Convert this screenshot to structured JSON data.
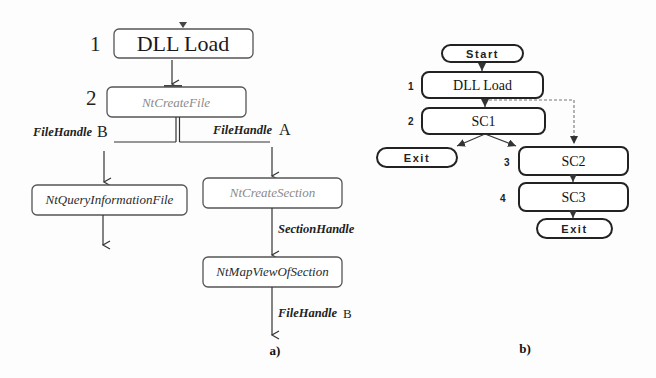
{
  "figure": {
    "panel_a": {
      "caption": "a)",
      "steps": {
        "s1": "1",
        "s2": "2"
      },
      "nodes": {
        "dll_load": "DLL Load",
        "nt_create_file": "NtCreateFile",
        "nt_query_information_file": "NtQueryInformationFile",
        "nt_create_section": "NtCreateSection",
        "nt_map_view_of_section": "NtMapViewOfSection"
      },
      "edge_labels": {
        "left_branch": {
          "text": "FileHandle",
          "suffix": "B"
        },
        "right_branch": {
          "text": "FileHandle",
          "suffix": "A"
        },
        "section_handle": {
          "text": "SectionHandle"
        },
        "map_output": {
          "text": "FileHandle",
          "suffix": "B"
        }
      }
    },
    "panel_b": {
      "caption": "b)",
      "steps": {
        "s1": "1",
        "s2": "2",
        "s3": "3",
        "s4": "4"
      },
      "nodes": {
        "start": "Start",
        "dll_load": "DLL Load",
        "sc1": "SC1",
        "exit_left": "Exit",
        "sc2": "SC2",
        "sc3": "SC3",
        "exit_bottom": "Exit"
      },
      "edges": [
        {
          "from": "Start",
          "to": "DLL Load",
          "style": "solid"
        },
        {
          "from": "DLL Load",
          "to": "SC1",
          "style": "solid"
        },
        {
          "from": "DLL Load",
          "to": "SC2",
          "style": "dashed"
        },
        {
          "from": "SC1",
          "to": "Exit",
          "style": "solid"
        },
        {
          "from": "SC1",
          "to": "SC2",
          "style": "solid"
        },
        {
          "from": "SC2",
          "to": "SC3",
          "style": "solid"
        },
        {
          "from": "SC3",
          "to": "Exit",
          "style": "solid"
        }
      ]
    },
    "colors": {
      "box_border_a": "#555555",
      "box_border_b": "#222222",
      "light_api_text": "#8a8a8a",
      "dark_text": "#222222"
    }
  }
}
